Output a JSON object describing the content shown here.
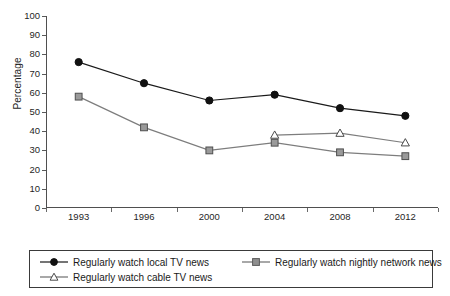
{
  "chart_data": {
    "type": "line",
    "title": "",
    "xlabel": "",
    "ylabel": "Percentage",
    "categories": [
      "1993",
      "1996",
      "2000",
      "2004",
      "2008",
      "2012"
    ],
    "ylim": [
      0,
      100
    ],
    "yticks": [
      0,
      10,
      20,
      30,
      40,
      50,
      60,
      70,
      80,
      90,
      100
    ],
    "grid": false,
    "legend_position": "bottom",
    "series": [
      {
        "name": "Regularly watch local TV news",
        "marker": "filled-circle",
        "color": "#1a1a1a",
        "values": [
          76,
          65,
          56,
          59,
          52,
          48
        ]
      },
      {
        "name": "Regularly watch nightly network news",
        "marker": "open-square",
        "color": "#8a8a8a",
        "values": [
          58,
          42,
          30,
          34,
          29,
          27
        ]
      },
      {
        "name": "Regularly watch cable TV news",
        "marker": "open-triangle",
        "color": "#8a8a8a",
        "values": [
          null,
          null,
          null,
          38,
          39,
          34
        ]
      }
    ]
  },
  "axis": {
    "y_title": "Percentage",
    "y_tick_labels": [
      "100",
      "90",
      "80",
      "70",
      "60",
      "50",
      "40",
      "30",
      "20",
      "10",
      "0"
    ],
    "x_tick_labels": [
      "1993",
      "1996",
      "2000",
      "2004",
      "2008",
      "2012"
    ]
  },
  "legend": {
    "entries": [
      {
        "label": "Regularly watch local TV news",
        "marker": "filled-circle"
      },
      {
        "label": "Regularly watch nightly network news",
        "marker": "open-square"
      },
      {
        "label": "Regularly watch cable TV news",
        "marker": "open-triangle"
      }
    ]
  },
  "colors": {
    "series_primary": "#1a1a1a",
    "series_secondary": "#8a8a8a",
    "axis": "#4f4f4f",
    "background": "#ffffff"
  }
}
